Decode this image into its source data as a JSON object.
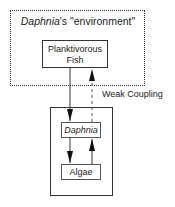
{
  "diagram": {
    "environment_label_italic": "Daphnia",
    "environment_label_rest": "'s \"environment\"",
    "fish_label_line1": "Planktivorous",
    "fish_label_line2": "Fish",
    "daphnia_label": "Daphnia",
    "algae_label": "Algae",
    "coupling_label": "Weak Coupling",
    "edges": [
      {
        "from": "Planktivorous Fish",
        "to": "Daphnia",
        "style": "solid"
      },
      {
        "from": "Daphnia",
        "to": "Planktivorous Fish",
        "style": "dashed"
      },
      {
        "from": "Daphnia",
        "to": "Algae",
        "style": "solid"
      },
      {
        "from": "Algae",
        "to": "Daphnia",
        "style": "solid"
      }
    ]
  }
}
